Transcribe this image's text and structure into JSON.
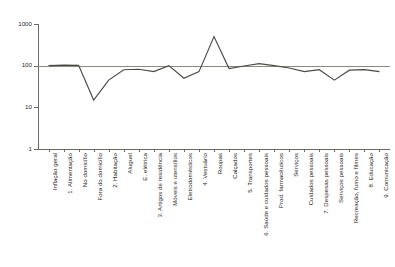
{
  "chart": {
    "type": "line",
    "background": "#ffffff",
    "line_color": "#4a4a45",
    "reference_line_color": "#8a8a80",
    "axis_color": "#6b6b63"
  },
  "chart_data": {
    "type": "line",
    "title": "",
    "subtitle": "",
    "xlabel": "",
    "ylabel": "",
    "yscale": "log",
    "ylim": [
      1,
      1000
    ],
    "ytick_labels": [
      "1000",
      "100",
      "10",
      "1"
    ],
    "ytick_values": [
      1000,
      100,
      10,
      1
    ],
    "grid": false,
    "legend": "none",
    "reference_line": 100,
    "categories": [
      "Inflação geral",
      "1. Alimentação",
      "No domicílio",
      "Fora do domicílio",
      "2. Habitação",
      "Aluguel",
      "E. elétrica",
      "3. Artigos de residência",
      "Móveis e utensílios",
      "Eletrodomésticos",
      "4. Vestuário",
      "Roupas",
      "Calçados",
      "5. Transportes",
      "6. Saúde e cuidados pessoais",
      "Prod. farmacêuticos",
      "Serviços",
      "Cuidados pessoais",
      "7. Despesas pessoais",
      "Serviços pessoais",
      "Recreação, fumo e filmes",
      "8. Educação",
      "9. Comunicação"
    ],
    "series": [
      {
        "name": "Índice",
        "values": [
          100,
          103,
          102,
          15,
          45,
          80,
          82,
          72,
          100,
          50,
          72,
          500,
          85,
          98,
          112,
          100,
          88,
          72,
          80,
          45,
          78,
          80,
          72
        ]
      }
    ]
  }
}
